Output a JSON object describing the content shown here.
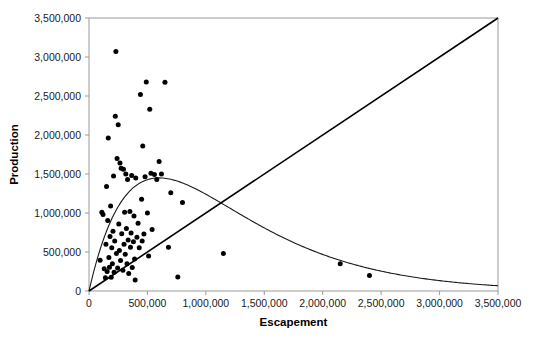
{
  "chart_data": {
    "type": "scatter",
    "title": "",
    "subtitle": "",
    "xlabel": "Escapement",
    "ylabel": "Production",
    "xlim": [
      0,
      3500000
    ],
    "ylim": [
      0,
      3500000
    ],
    "grid": false,
    "legend": "none",
    "xticks": [
      0,
      500000,
      1000000,
      1500000,
      2000000,
      2500000,
      3000000,
      3500000
    ],
    "yticks": [
      0,
      500000,
      1000000,
      1500000,
      2000000,
      2500000,
      3000000,
      3500000
    ],
    "xticklabels": [
      "0",
      "500,000",
      "1,000,000",
      "1,500,000",
      "2,000,000",
      "2,500,000",
      "3,000,000",
      "3,500,000"
    ],
    "yticklabels": [
      "0",
      "500,000",
      "1,000,000",
      "1,500,000",
      "2,000,000",
      "2,500,000",
      "3,000,000",
      "3,500,000"
    ],
    "point_color": "#000000",
    "curve_color": "#1a1a1a",
    "line_color": "#000000",
    "axis_color": "#9a9a9a",
    "series": [
      {
        "name": "Observations",
        "type": "scatter",
        "points": [
          [
            95000,
            395000
          ],
          [
            110000,
            1010000
          ],
          [
            120000,
            980000
          ],
          [
            130000,
            285000
          ],
          [
            140000,
            170000
          ],
          [
            145000,
            600000
          ],
          [
            150000,
            1340000
          ],
          [
            155000,
            250000
          ],
          [
            160000,
            905000
          ],
          [
            165000,
            1960000
          ],
          [
            170000,
            430000
          ],
          [
            175000,
            305000
          ],
          [
            180000,
            700000
          ],
          [
            185000,
            1090000
          ],
          [
            190000,
            175000
          ],
          [
            195000,
            555000
          ],
          [
            200000,
            350000
          ],
          [
            205000,
            765000
          ],
          [
            210000,
            1475000
          ],
          [
            215000,
            240000
          ],
          [
            220000,
            640000
          ],
          [
            225000,
            2240000
          ],
          [
            230000,
            3070000
          ],
          [
            235000,
            480000
          ],
          [
            240000,
            1700000
          ],
          [
            245000,
            295000
          ],
          [
            250000,
            2130000
          ],
          [
            255000,
            860000
          ],
          [
            260000,
            520000
          ],
          [
            265000,
            1640000
          ],
          [
            270000,
            390000
          ],
          [
            275000,
            1575000
          ],
          [
            280000,
            735000
          ],
          [
            290000,
            265000
          ],
          [
            295000,
            1560000
          ],
          [
            300000,
            600000
          ],
          [
            305000,
            1010000
          ],
          [
            310000,
            470000
          ],
          [
            315000,
            1500000
          ],
          [
            320000,
            800000
          ],
          [
            325000,
            350000
          ],
          [
            330000,
            1430000
          ],
          [
            335000,
            655000
          ],
          [
            340000,
            225000
          ],
          [
            350000,
            1020000
          ],
          [
            355000,
            560000
          ],
          [
            360000,
            745000
          ],
          [
            365000,
            1480000
          ],
          [
            370000,
            300000
          ],
          [
            380000,
            630000
          ],
          [
            385000,
            960000
          ],
          [
            390000,
            410000
          ],
          [
            395000,
            140000
          ],
          [
            400000,
            1450000
          ],
          [
            410000,
            690000
          ],
          [
            420000,
            870000
          ],
          [
            430000,
            555000
          ],
          [
            440000,
            2520000
          ],
          [
            450000,
            1175000
          ],
          [
            455000,
            640000
          ],
          [
            460000,
            1860000
          ],
          [
            470000,
            730000
          ],
          [
            480000,
            1465000
          ],
          [
            490000,
            2680000
          ],
          [
            500000,
            1000000
          ],
          [
            510000,
            450000
          ],
          [
            520000,
            2330000
          ],
          [
            530000,
            1510000
          ],
          [
            540000,
            790000
          ],
          [
            560000,
            1495000
          ],
          [
            580000,
            1430000
          ],
          [
            600000,
            1660000
          ],
          [
            620000,
            1500000
          ],
          [
            650000,
            2675000
          ],
          [
            680000,
            560000
          ],
          [
            700000,
            1260000
          ],
          [
            760000,
            180000
          ],
          [
            800000,
            1135000
          ],
          [
            1150000,
            480000
          ],
          [
            2150000,
            350000
          ],
          [
            2400000,
            200000
          ]
        ]
      },
      {
        "name": "Ricker fit",
        "type": "curve",
        "description": "Ricker stock-recruitment curve peaking near (600,000, 1,450,000)",
        "peak": [
          600000,
          1450000
        ],
        "endpoint_value": 90000
      },
      {
        "name": "Replacement line",
        "type": "line",
        "description": "1:1 replacement line from origin to (3,500,000, 3,500,000)",
        "from": [
          0,
          0
        ],
        "to": [
          3500000,
          3500000
        ]
      }
    ]
  }
}
